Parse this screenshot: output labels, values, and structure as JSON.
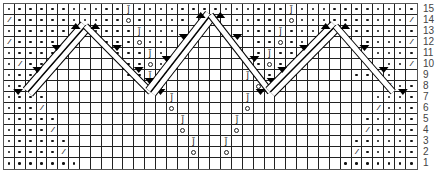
{
  "chart_data": {
    "type": "table",
    "title": "",
    "columns": 38,
    "row_count": 15,
    "row_labels": [
      "15",
      "14",
      "13",
      "12",
      "11",
      "10",
      "9",
      "8",
      "7",
      "6",
      "5",
      "4",
      "3",
      "2",
      "1"
    ],
    "legend": {
      ".": "purl (dot)",
      "_": "knit (blank)",
      "/": "decrease",
      "Q": "twisted stitch symbol",
      "O": "yarn over"
    },
    "rows": [
      "...........Q..............Q...........",
      "/..........O.....____.....O........../",
      "......__....Q...______...Q....__......",
      "/....____...O..________..O...____..../",
      "....._____...Q.________.Q...._____.....",
      "./.._______..O.________.O..._______../.",
      "...._______..Q________Q.._______....",
      "../___________O________O___________/..",
      "....___________Q______Q___________....",
      ".../___________O______O___________/...",
      ".....___________Q____Q___________.....",
      "..../___________O____O___________/....",
      "......___________Q__Q___________......",
      "...../___________O__O___________/.....",
      ".......________________________......."
    ],
    "cables": [
      {
        "name": "left-tent-left-leg",
        "from": [
          7.5,
          2
        ],
        "to": [
          2.2,
          8
        ],
        "double": true
      },
      {
        "name": "left-tent-right-leg",
        "from": [
          7.5,
          2
        ],
        "to": [
          13.5,
          8
        ],
        "double": false
      },
      {
        "name": "center-tent-left-leg",
        "from": [
          19,
          1
        ],
        "to": [
          13.5,
          8
        ],
        "double": true
      },
      {
        "name": "center-tent-right-leg",
        "from": [
          19,
          1
        ],
        "to": [
          24.5,
          8
        ],
        "double": false
      },
      {
        "name": "right-tent-left-leg",
        "from": [
          30.5,
          2
        ],
        "to": [
          24.5,
          8
        ],
        "double": true
      },
      {
        "name": "right-tent-right-leg",
        "from": [
          30.5,
          2
        ],
        "to": [
          35.8,
          8
        ],
        "double": false
      }
    ]
  },
  "symbols": {
    "dec": "⁄",
    "tw": "ǰ"
  }
}
